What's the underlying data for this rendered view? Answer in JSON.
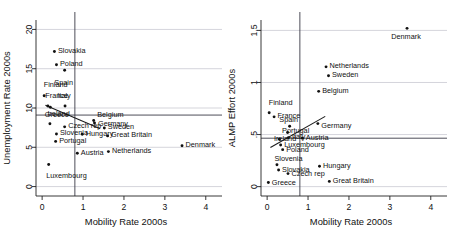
{
  "figure": {
    "width": 450,
    "height": 242,
    "background": "#ffffff",
    "point_color": "#111111",
    "grid_color": "#b9b9c4",
    "fitline_color": "#1a1a1a",
    "panels": 2
  },
  "chart_data": [
    {
      "type": "scatter",
      "panel": "left",
      "title": "",
      "xlabel": "Mobility Rate 2000s",
      "ylabel": "Unemployment Rate 2000s",
      "xlim": [
        -0.15,
        4.25
      ],
      "ylim": [
        -1.2,
        21.2
      ],
      "xticks": [
        0,
        1,
        2,
        3,
        4
      ],
      "xticklabels": [
        "0",
        "1",
        "2",
        "3",
        "4"
      ],
      "yticks": [
        0,
        5,
        10,
        15,
        20
      ],
      "yticklabels": [
        "0",
        "5",
        "10",
        "15",
        "20"
      ],
      "grid": true,
      "gridlines_y": [
        0,
        5,
        10,
        15,
        20
      ],
      "legend": "none",
      "reference_line_vertical_x": 0.8,
      "reference_line_horizontal_y": 9.1,
      "fit_line": {
        "x0": 0.08,
        "y0": 10.35,
        "x1": 1.42,
        "y1": 7.35
      },
      "points": [
        {
          "label": "Slovakia",
          "x": 0.3,
          "y": 17.2,
          "label_dx": 3.5,
          "label_dy": 0.15,
          "anchor": "start"
        },
        {
          "label": "Poland",
          "x": 0.35,
          "y": 15.5,
          "label_dx": 3.5,
          "label_dy": 0.15,
          "anchor": "start"
        },
        {
          "label": "Spain",
          "x": 0.55,
          "y": 14.8,
          "label_dx": -1.0,
          "label_dy": -1.55,
          "anchor": "middle"
        },
        {
          "label": "Finland",
          "x": 0.05,
          "y": 11.55,
          "label_dx": -0.5,
          "label_dy": 1.45,
          "anchor": "start"
        },
        {
          "label": "France",
          "x": 0.14,
          "y": 10.25,
          "label_dx": -2.5,
          "label_dy": 1.35,
          "anchor": "start"
        },
        {
          "label": "Italy",
          "x": 0.56,
          "y": 10.25,
          "label_dx": -1.0,
          "label_dy": 1.35,
          "anchor": "middle"
        },
        {
          "label": "Greece",
          "x": 0.2,
          "y": 10.1,
          "label_dx": -5.5,
          "label_dy": -0.95,
          "anchor": "start"
        },
        {
          "label": "Belgium",
          "x": 1.26,
          "y": 8.4,
          "label_dx": 3.5,
          "label_dy": 0.8,
          "anchor": "start"
        },
        {
          "label": "Germany",
          "x": 1.28,
          "y": 8.1,
          "label_dx": 3.5,
          "label_dy": -0.05,
          "anchor": "start"
        },
        {
          "label": "Ireland",
          "x": 0.19,
          "y": 8.0,
          "label_dx": -2.5,
          "label_dy": 1.25,
          "anchor": "start"
        },
        {
          "label": "Czech rep",
          "x": 0.55,
          "y": 7.6,
          "label_dx": 3.5,
          "label_dy": 0.15,
          "anchor": "start"
        },
        {
          "label": "Sweden",
          "x": 1.52,
          "y": 7.45,
          "label_dx": 3.5,
          "label_dy": 0.15,
          "anchor": "start"
        },
        {
          "label": "Slovenia",
          "x": 0.35,
          "y": 6.7,
          "label_dx": 3.5,
          "label_dy": 0.15,
          "anchor": "start"
        },
        {
          "label": "Hungary",
          "x": 0.98,
          "y": 6.65,
          "label_dx": 3.5,
          "label_dy": 0.15,
          "anchor": "start"
        },
        {
          "label": "Great Britain",
          "x": 1.6,
          "y": 6.45,
          "label_dx": 3.5,
          "label_dy": 0.15,
          "anchor": "start"
        },
        {
          "label": "Portugal",
          "x": 0.33,
          "y": 5.75,
          "label_dx": 3.5,
          "label_dy": 0.15,
          "anchor": "start"
        },
        {
          "label": "Denmark",
          "x": 3.42,
          "y": 5.2,
          "label_dx": 3.5,
          "label_dy": 0.15,
          "anchor": "start"
        },
        {
          "label": "Netherlands",
          "x": 1.62,
          "y": 4.45,
          "label_dx": 3.5,
          "label_dy": 0.15,
          "anchor": "start"
        },
        {
          "label": "Austria",
          "x": 0.86,
          "y": 4.25,
          "label_dx": 3.5,
          "label_dy": 0.15,
          "anchor": "start"
        },
        {
          "label": "Luxembourg",
          "x": 0.16,
          "y": 2.8,
          "label_dx": -2.5,
          "label_dy": -1.4,
          "anchor": "start"
        }
      ]
    },
    {
      "type": "scatter",
      "panel": "right",
      "title": "",
      "xlabel": "Mobility Rate 2000s",
      "ylabel": "ALMP Effort 2000s",
      "xlim": [
        -0.15,
        4.25
      ],
      "ylim": [
        -0.09,
        1.6
      ],
      "xticks": [
        0,
        1,
        2,
        3,
        4
      ],
      "xticklabels": [
        "0",
        "1",
        "2",
        "3",
        "4"
      ],
      "yticks": [
        0,
        0.5,
        1,
        1.5
      ],
      "yticklabels": [
        "0",
        ".5",
        "1",
        "1.5"
      ],
      "grid": true,
      "gridlines_y": [
        0,
        0.5,
        1,
        1.5
      ],
      "legend": "none",
      "reference_line_vertical_x": 0.8,
      "reference_line_horizontal_y": 0.465,
      "fit_line": {
        "x0": 0.08,
        "y0": 0.375,
        "x1": 1.42,
        "y1": 0.675
      },
      "points": [
        {
          "label": "Denmark",
          "x": 3.42,
          "y": 1.52,
          "label_dx": -1.0,
          "label_dy": -0.075,
          "anchor": "middle"
        },
        {
          "label": "Netherlands",
          "x": 1.44,
          "y": 1.15,
          "label_dx": 3.5,
          "label_dy": 0.012,
          "anchor": "start"
        },
        {
          "label": "Sweden",
          "x": 1.5,
          "y": 1.065,
          "label_dx": 3.5,
          "label_dy": 0.012,
          "anchor": "start"
        },
        {
          "label": "Belgium",
          "x": 1.26,
          "y": 0.915,
          "label_dx": 3.5,
          "label_dy": 0.012,
          "anchor": "start"
        },
        {
          "label": "Finland",
          "x": 0.05,
          "y": 0.71,
          "label_dx": -0.5,
          "label_dy": 0.095,
          "anchor": "start"
        },
        {
          "label": "France",
          "x": 0.17,
          "y": 0.67,
          "label_dx": 3.5,
          "label_dy": 0.012,
          "anchor": "start"
        },
        {
          "label": "Germany",
          "x": 1.24,
          "y": 0.605,
          "label_dx": 3.5,
          "label_dy": -0.015,
          "anchor": "start"
        },
        {
          "label": "Spain",
          "x": 0.55,
          "y": 0.58,
          "label_dx": -1.0,
          "label_dy": 0.07,
          "anchor": "middle"
        },
        {
          "label": "Portugal",
          "x": 0.5,
          "y": 0.52,
          "label_dx": -5.5,
          "label_dy": 0.022,
          "anchor": "start"
        },
        {
          "label": "Italy",
          "x": 0.52,
          "y": 0.47,
          "label_dx": 3.5,
          "label_dy": 0.012,
          "anchor": "start"
        },
        {
          "label": "Austria",
          "x": 0.86,
          "y": 0.465,
          "label_dx": 3.5,
          "label_dy": 0.012,
          "anchor": "start"
        },
        {
          "label": "Ireland",
          "x": 0.3,
          "y": 0.455,
          "label_dx": -5.5,
          "label_dy": 0.012,
          "anchor": "start"
        },
        {
          "label": "Luxembourg",
          "x": 0.33,
          "y": 0.4,
          "label_dx": 3.5,
          "label_dy": 0.005,
          "anchor": "start"
        },
        {
          "label": "Poland",
          "x": 0.38,
          "y": 0.355,
          "label_dx": 3.5,
          "label_dy": 0.005,
          "anchor": "start"
        },
        {
          "label": "Slovenia",
          "x": 0.24,
          "y": 0.21,
          "label_dx": -2.5,
          "label_dy": 0.06,
          "anchor": "start"
        },
        {
          "label": "Hungary",
          "x": 1.28,
          "y": 0.195,
          "label_dx": 3.5,
          "label_dy": 0.012,
          "anchor": "start"
        },
        {
          "label": "Slovakia",
          "x": 0.28,
          "y": 0.16,
          "label_dx": 3.5,
          "label_dy": 0.005,
          "anchor": "start"
        },
        {
          "label": "Czech rep",
          "x": 0.51,
          "y": 0.125,
          "label_dx": 3.5,
          "label_dy": 0.005,
          "anchor": "start"
        },
        {
          "label": "Great Britain",
          "x": 1.52,
          "y": 0.05,
          "label_dx": 3.5,
          "label_dy": 0.012,
          "anchor": "start"
        },
        {
          "label": "Greece",
          "x": 0.03,
          "y": 0.04,
          "label_dx": 3.5,
          "label_dy": 0.005,
          "anchor": "start"
        }
      ]
    }
  ]
}
